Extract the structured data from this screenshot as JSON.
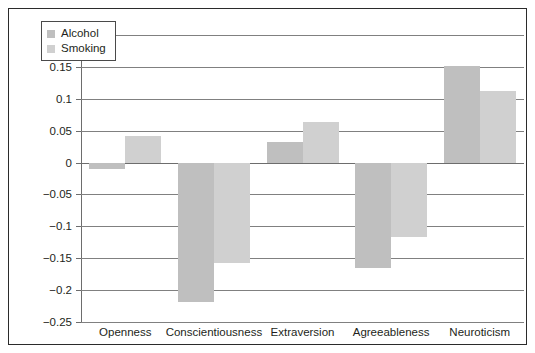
{
  "chart_data": {
    "type": "bar",
    "title": "",
    "subtitle": "",
    "xlabel": "",
    "ylabel": "",
    "categories": [
      "Openness",
      "Conscientiousness",
      "Extraversion",
      "Agreeableness",
      "Neuroticism"
    ],
    "series": [
      {
        "name": "Alcohol",
        "color": "#bfbfbf",
        "values": [
          -0.01,
          -0.218,
          0.032,
          -0.165,
          0.152
        ]
      },
      {
        "name": "Smoking",
        "color": "#d0d0d0",
        "values": [
          0.041,
          -0.158,
          0.063,
          -0.117,
          0.112
        ]
      }
    ],
    "ylim": [
      -0.25,
      0.2
    ],
    "ytick_values": [
      0.2,
      0.15,
      0.1,
      0.05,
      0,
      -0.05,
      -0.1,
      -0.15,
      -0.2,
      -0.25
    ],
    "ytick_labels": [
      "0.2",
      "0.15",
      "0.1",
      "0.05",
      "0",
      "−0.05",
      "−0.1",
      "−0.15",
      "−0.2",
      "−0.25"
    ],
    "grid": true,
    "grid_color": "#808080",
    "legend_position": "top-left",
    "frame": true,
    "frame_color": "#2b2b2b",
    "background": "#ffffff"
  },
  "legend": {
    "entries": [
      {
        "label": "Alcohol",
        "swatch": "legend-swatch-alcohol"
      },
      {
        "label": "Smoking",
        "swatch": "legend-swatch-smoking"
      }
    ]
  }
}
